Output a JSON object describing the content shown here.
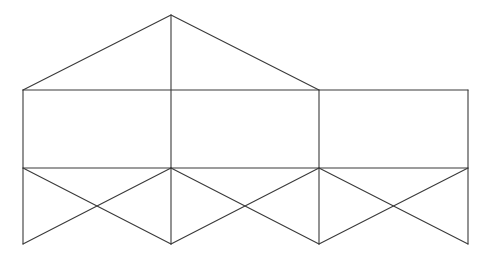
{
  "diagram": {
    "type": "line-drawing",
    "stroke_color": "#3a3a3a",
    "background_color": "#ffffff",
    "points": {
      "apex": [
        171,
        15
      ],
      "roof_left": [
        23,
        90
      ],
      "roof_mid": [
        171,
        90
      ],
      "roof_right": [
        319,
        90
      ],
      "right_top": [
        468,
        90
      ],
      "mid_left": [
        23,
        168
      ],
      "mid_center": [
        171,
        168
      ],
      "mid_right": [
        319,
        168
      ],
      "mid_far": [
        468,
        168
      ],
      "bot_left": [
        23,
        244
      ],
      "bot_center": [
        171,
        244
      ],
      "bot_right": [
        319,
        244
      ],
      "bot_far": [
        468,
        244
      ]
    },
    "segments": [
      {
        "name": "roof-left-edge",
        "from": [
          23,
          90
        ],
        "to": [
          171,
          15
        ]
      },
      {
        "name": "roof-right-edge",
        "from": [
          171,
          15
        ],
        "to": [
          319,
          90
        ]
      },
      {
        "name": "roof-center-vertical",
        "from": [
          171,
          15
        ],
        "to": [
          171,
          168
        ]
      },
      {
        "name": "top-horizontal",
        "from": [
          23,
          90
        ],
        "to": [
          468,
          90
        ]
      },
      {
        "name": "left-vertical",
        "from": [
          23,
          90
        ],
        "to": [
          23,
          244
        ]
      },
      {
        "name": "inner-vertical-319",
        "from": [
          319,
          90
        ],
        "to": [
          319,
          244
        ]
      },
      {
        "name": "right-vertical",
        "from": [
          468,
          90
        ],
        "to": [
          468,
          244
        ]
      },
      {
        "name": "middle-horizontal",
        "from": [
          23,
          168
        ],
        "to": [
          468,
          168
        ]
      },
      {
        "name": "center-lower-vertical",
        "from": [
          171,
          168
        ],
        "to": [
          171,
          244
        ]
      },
      {
        "name": "panel1-diag-a",
        "from": [
          23,
          168
        ],
        "to": [
          171,
          244
        ]
      },
      {
        "name": "panel1-diag-b",
        "from": [
          23,
          244
        ],
        "to": [
          171,
          168
        ]
      },
      {
        "name": "panel2-diag-a",
        "from": [
          171,
          168
        ],
        "to": [
          319,
          244
        ]
      },
      {
        "name": "panel2-diag-b",
        "from": [
          171,
          244
        ],
        "to": [
          319,
          168
        ]
      },
      {
        "name": "panel3-diag-a",
        "from": [
          319,
          168
        ],
        "to": [
          468,
          244
        ]
      },
      {
        "name": "panel3-diag-b",
        "from": [
          319,
          244
        ],
        "to": [
          468,
          168
        ]
      }
    ]
  }
}
